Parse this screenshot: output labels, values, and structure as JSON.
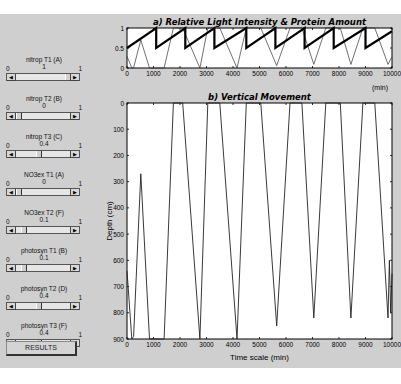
{
  "controls": [
    {
      "label": "nitrop T1 (A)",
      "min": "0",
      "max": "1",
      "value": "1",
      "pos": 1.0
    },
    {
      "label": "nitrop T2 (B)",
      "min": "0",
      "max": "1",
      "value": "0",
      "pos": 0.0
    },
    {
      "label": "nitrop T3 (C)",
      "min": "0",
      "max": "1",
      "value": "0.4",
      "pos": 0.4
    },
    {
      "label": "NO3ex T1 (A)",
      "min": "0",
      "max": "1",
      "value": "0",
      "pos": 0.0
    },
    {
      "label": "NO3ex T2 (F)",
      "min": "0",
      "max": "1",
      "value": "0.1",
      "pos": 0.1
    },
    {
      "label": "photosyn T1 (B)",
      "min": "0",
      "max": "1",
      "value": "0.1",
      "pos": 0.1
    },
    {
      "label": "photosyn T2 (D)",
      "min": "0",
      "max": "1",
      "value": "0.4",
      "pos": 0.4
    },
    {
      "label": "photosyn T3 (F)",
      "min": "0",
      "max": "1",
      "value": "0.4",
      "pos": 0.4
    }
  ],
  "results_button": "RESULTS",
  "chart_data": [
    {
      "type": "line",
      "title": "a)  Relative Light Intensity & Protein Amount",
      "xlabel": "(min)",
      "ylabel": "",
      "xlim": [
        0,
        10000
      ],
      "ylim": [
        0,
        1
      ],
      "xticks": [
        "0",
        "1000",
        "2000",
        "3000",
        "4000",
        "5000",
        "6000",
        "7000",
        "8000",
        "9000",
        "10000"
      ],
      "yticks": [
        "0",
        "0.5",
        "1"
      ],
      "grid": false,
      "series": [
        {
          "name": "Protein amount (thick)",
          "x": [
            0,
            1100,
            1100,
            2200,
            2200,
            3300,
            3300,
            4500,
            4500,
            5600,
            5600,
            6700,
            6700,
            7800,
            7800,
            9000,
            9000,
            10000
          ],
          "y": [
            0.5,
            1,
            0.5,
            1,
            0.5,
            1,
            0.5,
            1,
            0.5,
            1,
            0.5,
            1,
            0.5,
            1,
            0.5,
            1,
            0.5,
            0.92
          ]
        },
        {
          "name": "Relative light intensity (thin)",
          "x": [
            0,
            180,
            250,
            520,
            850,
            1400,
            1750,
            2100,
            2750,
            3050,
            3500,
            4150,
            4500,
            5050,
            5650,
            6150,
            6600,
            7050,
            7500,
            8050,
            8450,
            8900,
            9350,
            9850,
            10000
          ],
          "y": [
            0.29,
            0,
            0.01,
            0.7,
            0,
            0,
            1,
            1,
            0,
            1,
            1,
            0,
            1,
            1,
            0.06,
            1,
            1,
            0.09,
            1,
            1,
            0.09,
            1,
            1,
            0.09,
            0.28
          ]
        }
      ]
    },
    {
      "type": "line",
      "title": "b)  Vertical Movement",
      "xlabel": "Time scale (min)",
      "ylabel": "Depth (cm)",
      "xlim": [
        0,
        10000
      ],
      "ylim": [
        900,
        0
      ],
      "xticks": [
        "0",
        "1000",
        "2000",
        "3000",
        "4000",
        "5000",
        "6000",
        "7000",
        "8000",
        "9000",
        "10000"
      ],
      "yticks": [
        "0",
        "100",
        "200",
        "300",
        "400",
        "500",
        "600",
        "700",
        "800",
        "900"
      ],
      "grid": false,
      "series": [
        {
          "name": "Depth",
          "x": [
            0,
            180,
            250,
            520,
            850,
            1400,
            1750,
            2100,
            2750,
            3050,
            3500,
            4150,
            4500,
            5050,
            5650,
            6150,
            6600,
            7050,
            7500,
            8050,
            8450,
            8900,
            9350,
            9850,
            9900,
            9950,
            10000
          ],
          "y": [
            640,
            900,
            890,
            270,
            900,
            900,
            0,
            0,
            900,
            0,
            0,
            900,
            0,
            0,
            850,
            0,
            0,
            820,
            0,
            0,
            820,
            0,
            0,
            820,
            600,
            800,
            650
          ]
        }
      ]
    }
  ]
}
